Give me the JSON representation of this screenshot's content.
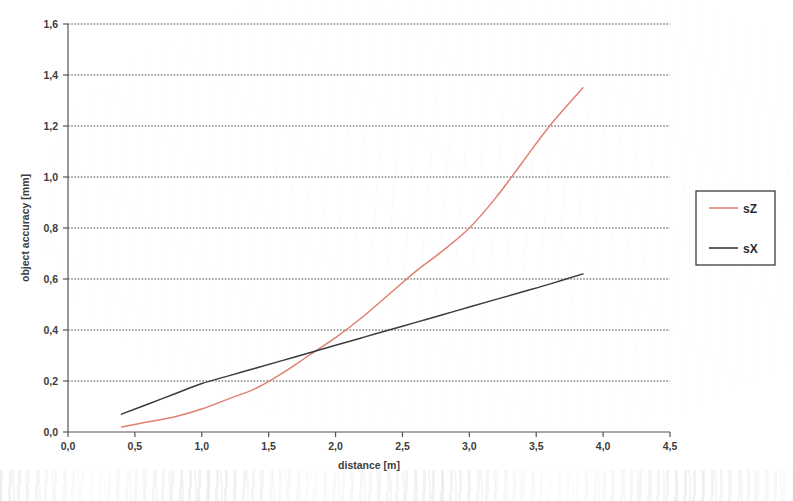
{
  "chart_data": {
    "type": "line",
    "title": "",
    "xlabel": "distance [m]",
    "ylabel": "object accuracy [mm]",
    "xlim": [
      0.0,
      4.5
    ],
    "ylim": [
      0.0,
      1.6
    ],
    "grid": "horizontal-dotted",
    "legend_position": "right-outside",
    "x_ticks": [
      "0,0",
      "0,5",
      "1,0",
      "1,5",
      "2,0",
      "2,5",
      "3,0",
      "3,5",
      "4,0",
      "4,5"
    ],
    "x_tick_values": [
      0.0,
      0.5,
      1.0,
      1.5,
      2.0,
      2.5,
      3.0,
      3.5,
      4.0,
      4.5
    ],
    "y_ticks": [
      "0,0",
      "0,2",
      "0,4",
      "0,6",
      "0,8",
      "1,0",
      "1,2",
      "1,4",
      "1,6"
    ],
    "y_tick_values": [
      0.0,
      0.2,
      0.4,
      0.6,
      0.8,
      1.0,
      1.2,
      1.4,
      1.6
    ],
    "series": [
      {
        "name": "sZ",
        "color": "#e08070",
        "x": [
          0.4,
          0.6,
          0.8,
          1.0,
          1.2,
          1.4,
          1.6,
          1.8,
          2.0,
          2.2,
          2.4,
          2.6,
          2.8,
          3.0,
          3.2,
          3.4,
          3.6,
          3.85
        ],
        "values": [
          0.02,
          0.04,
          0.06,
          0.09,
          0.13,
          0.17,
          0.23,
          0.3,
          0.37,
          0.45,
          0.54,
          0.63,
          0.71,
          0.8,
          0.92,
          1.06,
          1.2,
          1.35
        ]
      },
      {
        "name": "sX",
        "color": "#3b3b3b",
        "x": [
          0.4,
          0.6,
          0.8,
          1.0,
          1.2,
          1.4,
          1.6,
          1.8,
          2.0,
          2.2,
          2.4,
          2.6,
          2.8,
          3.0,
          3.2,
          3.4,
          3.6,
          3.85
        ],
        "values": [
          0.07,
          0.11,
          0.15,
          0.19,
          0.22,
          0.25,
          0.28,
          0.31,
          0.34,
          0.37,
          0.4,
          0.43,
          0.46,
          0.49,
          0.52,
          0.55,
          0.58,
          0.62
        ]
      }
    ]
  },
  "legend": {
    "entries": [
      {
        "label": "sZ",
        "color": "#e08070"
      },
      {
        "label": "sX",
        "color": "#3b3b3b"
      }
    ]
  },
  "axes": {
    "x_title": "distance [m]",
    "y_title": "object accuracy [mm]"
  }
}
